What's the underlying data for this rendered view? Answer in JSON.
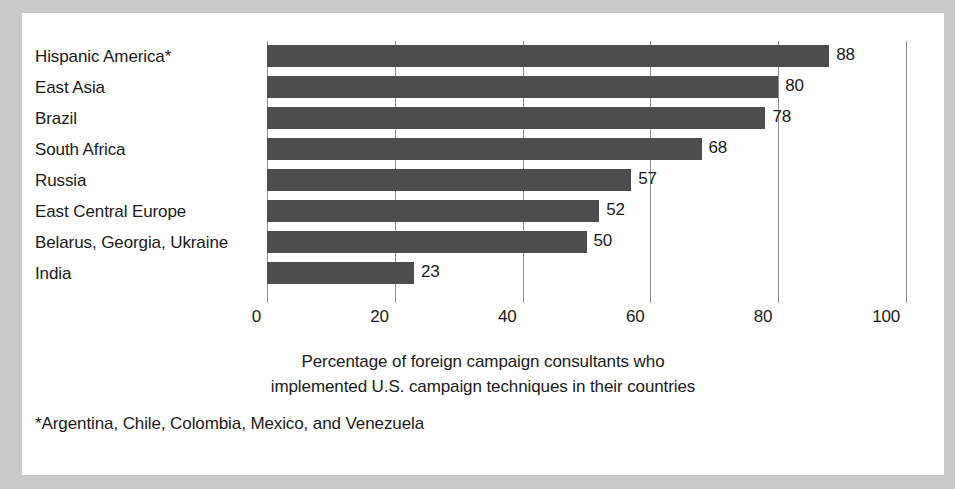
{
  "chart_data": {
    "type": "bar",
    "orientation": "horizontal",
    "title": "",
    "categories": [
      "Hispanic America*",
      "East Asia",
      "Brazil",
      "South Africa",
      "Russia",
      "East Central Europe",
      "Belarus, Georgia, Ukraine",
      "India"
    ],
    "values": [
      88,
      80,
      78,
      68,
      57,
      52,
      50,
      23
    ],
    "value_labels": [
      "88",
      "80",
      "78",
      "68",
      "57",
      "52",
      "50",
      "23"
    ],
    "xlabel": "",
    "ylabel": "",
    "xlim": [
      0,
      100
    ],
    "xticks": [
      0,
      20,
      40,
      60,
      80,
      100
    ],
    "xtick_labels": [
      "0",
      "20",
      "40",
      "60",
      "80",
      "100"
    ],
    "grid": true,
    "grid_axis": "x",
    "legend": false,
    "bar_color": "#4d4d4d",
    "gridline_color": "#909090",
    "text_color": "#1a1a1a",
    "panel_color": "#ffffff",
    "frame_color": "#c9c9c9",
    "caption_lines": [
      "Percentage of foreign campaign consultants who",
      "implemented U.S. campaign techniques in their countries"
    ],
    "footnote": "*Argentina, Chile, Colombia, Mexico, and Venezuela"
  }
}
